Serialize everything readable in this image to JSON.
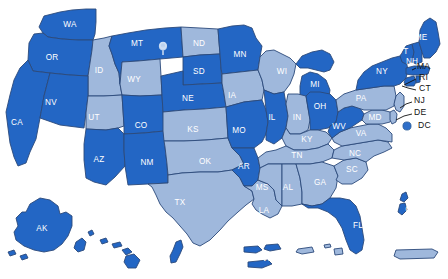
{
  "map": {
    "title": "United States map with states and territories",
    "colors": {
      "dark_blue": "#2366c4",
      "light_blue": "#9fb8dc",
      "border": "#2b4a7a",
      "background": "#ffffff",
      "outside_label_text": "#111111",
      "inside_label_text": "#ffffff"
    },
    "legend_note": "Two-tone choropleth: dark blue and light blue state fills",
    "states": [
      {
        "code": "WA",
        "shade": "dark",
        "label_x": 70,
        "label_y": 25
      },
      {
        "code": "OR",
        "shade": "dark",
        "label_x": 52,
        "label_y": 58
      },
      {
        "code": "ID",
        "shade": "light",
        "label_x": 99,
        "label_y": 71
      },
      {
        "code": "MT",
        "shade": "dark",
        "label_x": 137,
        "label_y": 44
      },
      {
        "code": "ND",
        "shade": "light",
        "label_x": 199,
        "label_y": 44
      },
      {
        "code": "MN",
        "shade": "dark",
        "label_x": 240,
        "label_y": 55
      },
      {
        "code": "WI",
        "shade": "light",
        "label_x": 282,
        "label_y": 72
      },
      {
        "code": "MI",
        "shade": "dark",
        "label_x": 315,
        "label_y": 85
      },
      {
        "code": "SD",
        "shade": "dark",
        "label_x": 199,
        "label_y": 72
      },
      {
        "code": "WY",
        "shade": "light",
        "label_x": 134,
        "label_y": 80
      },
      {
        "code": "NV",
        "shade": "dark",
        "label_x": 51,
        "label_y": 103
      },
      {
        "code": "CA",
        "shade": "dark",
        "label_x": 17,
        "label_y": 123
      },
      {
        "code": "UT",
        "shade": "light",
        "label_x": 94,
        "label_y": 118
      },
      {
        "code": "CO",
        "shade": "dark",
        "label_x": 141,
        "label_y": 126
      },
      {
        "code": "NE",
        "shade": "dark",
        "label_x": 188,
        "label_y": 99
      },
      {
        "code": "IA",
        "shade": "light",
        "label_x": 232,
        "label_y": 96
      },
      {
        "code": "IL",
        "shade": "dark",
        "label_x": 272,
        "label_y": 118
      },
      {
        "code": "IN",
        "shade": "light",
        "label_x": 297,
        "label_y": 118
      },
      {
        "code": "OH",
        "shade": "dark",
        "label_x": 320,
        "label_y": 107
      },
      {
        "code": "PA",
        "shade": "light",
        "label_x": 361,
        "label_y": 99
      },
      {
        "code": "NY",
        "shade": "dark",
        "label_x": 382,
        "label_y": 72
      },
      {
        "code": "VT",
        "shade": "dark",
        "label_x": 403,
        "label_y": 52
      },
      {
        "code": "ME",
        "shade": "dark",
        "label_x": 421,
        "label_y": 38
      },
      {
        "code": "NH",
        "shade": "dark",
        "label_x": 412,
        "label_y": 62
      },
      {
        "code": "KS",
        "shade": "light",
        "label_x": 193,
        "label_y": 130
      },
      {
        "code": "MO",
        "shade": "dark",
        "label_x": 239,
        "label_y": 131
      },
      {
        "code": "KY",
        "shade": "light",
        "label_x": 307,
        "label_y": 140
      },
      {
        "code": "WV",
        "shade": "dark",
        "label_x": 339,
        "label_y": 127
      },
      {
        "code": "VA",
        "shade": "light",
        "label_x": 361,
        "label_y": 134
      },
      {
        "code": "MD",
        "shade": "light",
        "label_x": 375,
        "label_y": 118
      },
      {
        "code": "AZ",
        "shade": "dark",
        "label_x": 99,
        "label_y": 160
      },
      {
        "code": "NM",
        "shade": "dark",
        "label_x": 147,
        "label_y": 163
      },
      {
        "code": "OK",
        "shade": "light",
        "label_x": 205,
        "label_y": 162
      },
      {
        "code": "AR",
        "shade": "dark",
        "label_x": 244,
        "label_y": 167
      },
      {
        "code": "TN",
        "shade": "light",
        "label_x": 297,
        "label_y": 156
      },
      {
        "code": "NC",
        "shade": "light",
        "label_x": 355,
        "label_y": 154
      },
      {
        "code": "SC",
        "shade": "light",
        "label_x": 352,
        "label_y": 170
      },
      {
        "code": "MS",
        "shade": "light",
        "label_x": 262,
        "label_y": 188
      },
      {
        "code": "AL",
        "shade": "light",
        "label_x": 288,
        "label_y": 188
      },
      {
        "code": "GA",
        "shade": "light",
        "label_x": 320,
        "label_y": 183
      },
      {
        "code": "TX",
        "shade": "light",
        "label_x": 180,
        "label_y": 203
      },
      {
        "code": "LA",
        "shade": "light",
        "label_x": 264,
        "label_y": 211
      },
      {
        "code": "FL",
        "shade": "dark",
        "label_x": 358,
        "label_y": 226
      },
      {
        "code": "AK",
        "shade": "dark",
        "label_x": 42,
        "label_y": 229
      },
      {
        "code": "HI",
        "shade": "dark",
        "label_x": 118,
        "label_y": 261
      },
      {
        "code": "GU",
        "shade": "dark",
        "label_x": 189,
        "label_y": 262
      },
      {
        "code": "VI",
        "shade": "dark",
        "label_x": 266,
        "label_y": 259
      },
      {
        "code": "AS",
        "shade": "light",
        "label_x": 318,
        "label_y": 259
      },
      {
        "code": "PR",
        "shade": "light",
        "label_x": 415,
        "label_y": 265
      },
      {
        "code": "CNMI",
        "shade": "dark",
        "label_x": 416,
        "label_y": 210
      }
    ],
    "callouts": [
      {
        "code": "MA",
        "shade": "dark",
        "label_x": 417,
        "label_y": 67
      },
      {
        "code": "RI",
        "shade": "dark",
        "label_x": 419,
        "label_y": 78
      },
      {
        "code": "CT",
        "shade": "dark",
        "label_x": 419,
        "label_y": 89
      },
      {
        "code": "NJ",
        "shade": "light",
        "label_x": 414,
        "label_y": 101
      },
      {
        "code": "DE",
        "shade": "light",
        "label_x": 414,
        "label_y": 113
      },
      {
        "code": "DC",
        "shade": "dark",
        "label_x": 418,
        "label_y": 126
      }
    ],
    "markers": [
      {
        "name": "montana-pin",
        "x": 163,
        "y": 48
      },
      {
        "name": "dc-dot",
        "x": 407,
        "y": 126
      }
    ]
  }
}
